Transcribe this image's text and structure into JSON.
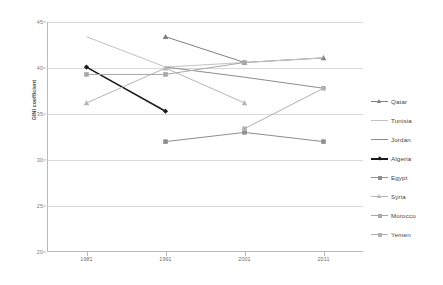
{
  "chart_data": {
    "type": "line",
    "title": "",
    "xlabel": "",
    "ylabel": "GINI coefficient",
    "categories": [
      "1981",
      "1991",
      "2001",
      "2011"
    ],
    "ylim": [
      20,
      45
    ],
    "yticks": [
      20,
      25,
      30,
      35,
      40,
      45
    ],
    "grid": true,
    "legend_position": "right",
    "series": [
      {
        "name": "Qatar",
        "color": "#7f7f7f",
        "marker": "triangle",
        "values": [
          null,
          43.4,
          40.6,
          41.1
        ]
      },
      {
        "name": "Tunisia",
        "color": "#c2c2c2",
        "marker": "none",
        "values": [
          43.4,
          40.1,
          40.6,
          41.1
        ]
      },
      {
        "name": "Jordan",
        "color": "#8c8c8c",
        "marker": "none",
        "values": [
          null,
          40.1,
          39.0,
          37.8
        ]
      },
      {
        "name": "Algeria",
        "color": "#1a1a1a",
        "marker": "diamond",
        "values": [
          40.1,
          35.3,
          null,
          null
        ]
      },
      {
        "name": "Egypt",
        "color": "#8e8e8e",
        "marker": "square",
        "values": [
          null,
          32.0,
          33.0,
          32.0
        ]
      },
      {
        "name": "Syria",
        "color": "#b5b5b5",
        "marker": "triangle",
        "values": [
          36.2,
          40.0,
          36.2,
          null
        ]
      },
      {
        "name": "Morocco",
        "color": "#a8a8a8",
        "marker": "square",
        "values": [
          39.3,
          39.3,
          40.6,
          null
        ]
      },
      {
        "name": "Yemen",
        "color": "#b0b0b0",
        "marker": "square",
        "values": [
          null,
          null,
          33.4,
          37.8
        ]
      }
    ]
  }
}
